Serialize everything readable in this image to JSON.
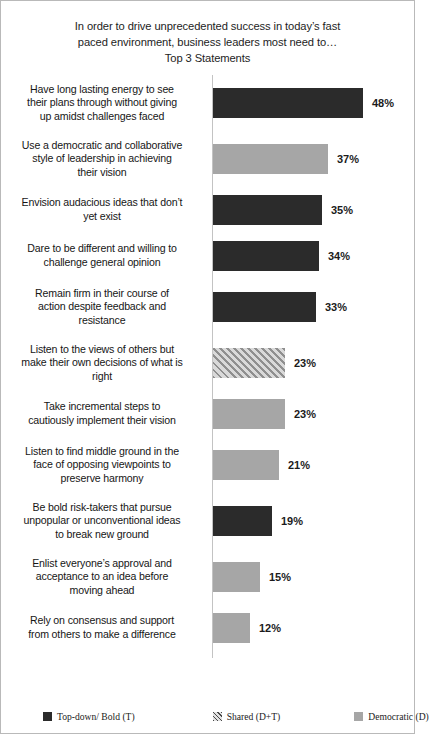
{
  "chart_data": {
    "type": "bar",
    "orientation": "horizontal",
    "title_lines": [
      "In order to drive unprecedented success in today’s fast",
      "paced environment, business leaders most need to…",
      "Top 3 Statements"
    ],
    "title": "In order to drive unprecedented success in today’s fast paced environment, business leaders most need to… Top 3 Statements",
    "xlabel": "",
    "ylabel": "",
    "grid": false,
    "xlim": [
      0,
      60
    ],
    "axis_max_percent": 60,
    "legend_position": "bottom",
    "categories": [
      "Have long lasting energy to see their plans through without giving up amidst challenges faced",
      "Use a democratic and collaborative style of leadership  in achieving their vision",
      "Envision audacious ideas that don’t yet exist",
      "Dare to be different and willing to challenge  general opinion",
      "Remain firm in their course of action despite feedback and resistance",
      "Listen to the views of others but make their own decisions of what is right",
      "Take incremental steps to cautiously implement their vision",
      "Listen to find middle ground in the face of opposing viewpoints  to preserve harmony",
      "Be bold risk-takers  that pursue unpopular or unconventional ideas to break new ground",
      "Enlist everyone’s approval and acceptance to an idea before moving ahead",
      "Rely on consensus and support from others to make a difference"
    ],
    "values": [
      48,
      37,
      35,
      34,
      33,
      23,
      23,
      21,
      19,
      15,
      12
    ],
    "value_labels": [
      "48%",
      "37%",
      "35%",
      "34%",
      "33%",
      "23%",
      "23%",
      "21%",
      "19%",
      "15%",
      "12%"
    ],
    "series_assignment": [
      "dark",
      "gray",
      "dark",
      "dark",
      "dark",
      "hatch",
      "gray",
      "gray",
      "dark",
      "gray",
      "gray"
    ],
    "colors": {
      "dark": "#2b2b2b",
      "gray": "#a6a6a6",
      "hatch": "#c9c9c9",
      "axis": "#c3c3c3",
      "border": "#b9b9b9",
      "text": "#161616"
    },
    "bars": [
      {
        "label_lines": [
          "Have long lasting energy to see",
          "their plans through without giving",
          "up amidst challenges faced"
        ],
        "value": 48,
        "value_label": "48%",
        "style": "dark"
      },
      {
        "label_lines": [
          "Use a democratic and collaborative",
          "style of leadership  in achieving",
          "their vision"
        ],
        "value": 37,
        "value_label": "37%",
        "style": "gray"
      },
      {
        "label_lines": [
          "Envision audacious ideas that don’t",
          "yet exist"
        ],
        "value": 35,
        "value_label": "35%",
        "style": "dark"
      },
      {
        "label_lines": [
          "Dare to be different and willing to",
          "challenge  general opinion"
        ],
        "value": 34,
        "value_label": "34%",
        "style": "dark"
      },
      {
        "label_lines": [
          "Remain firm in their course of",
          "action despite feedback and",
          "resistance"
        ],
        "value": 33,
        "value_label": "33%",
        "style": "dark"
      },
      {
        "label_lines": [
          "Listen to the views of others but",
          "make their own decisions of what is",
          "right"
        ],
        "value": 23,
        "value_label": "23%",
        "style": "hatch"
      },
      {
        "label_lines": [
          "Take incremental steps to",
          "cautiously implement their vision"
        ],
        "value": 23,
        "value_label": "23%",
        "style": "gray"
      },
      {
        "label_lines": [
          "Listen to find middle ground in the",
          "face of opposing viewpoints  to",
          "preserve harmony"
        ],
        "value": 21,
        "value_label": "21%",
        "style": "gray"
      },
      {
        "label_lines": [
          "Be bold risk-takers  that pursue",
          "unpopular or unconventional ideas",
          "to break new ground"
        ],
        "value": 19,
        "value_label": "19%",
        "style": "dark"
      },
      {
        "label_lines": [
          "Enlist everyone’s approval and",
          "acceptance to an idea before",
          "moving ahead"
        ],
        "value": 15,
        "value_label": "15%",
        "style": "gray"
      },
      {
        "label_lines": [
          "Rely on consensus and support",
          "from others to make a difference"
        ],
        "value": 12,
        "value_label": "12%",
        "style": "gray"
      }
    ],
    "legend": [
      {
        "label": "Top-down/ Bold (T)",
        "style": "dark"
      },
      {
        "label": "Shared (D+T)",
        "style": "hatch"
      },
      {
        "label": "Democratic (D)",
        "style": "gray"
      }
    ]
  }
}
